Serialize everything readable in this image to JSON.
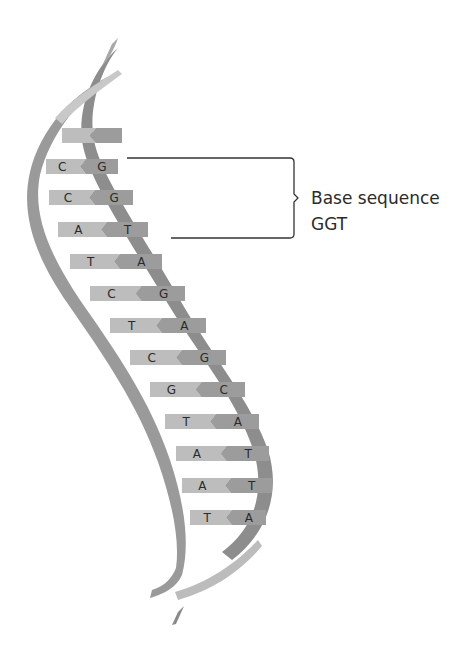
{
  "diagram": {
    "label": {
      "line1": "Base sequence",
      "line2": "GGT"
    },
    "colors": {
      "strand_back": "#8a8a8a",
      "strand_front": "#9a9a9a",
      "strand_light": "#c4c4c4",
      "base_light": "#bdbdbd",
      "base_dark": "#9c9c9c",
      "bracket": "#333333",
      "text": "#2b2b2b"
    },
    "rungs": [
      {
        "left": "",
        "right": "",
        "x": 62,
        "y": 128,
        "w": 60
      },
      {
        "left": "C",
        "right": "G",
        "x": 46,
        "y": 159,
        "w": 72
      },
      {
        "left": "C",
        "right": "G",
        "x": 49,
        "y": 190,
        "w": 84
      },
      {
        "left": "A",
        "right": "T",
        "x": 58,
        "y": 222,
        "w": 90
      },
      {
        "left": "T",
        "right": "A",
        "x": 70,
        "y": 254,
        "w": 92
      },
      {
        "left": "C",
        "right": "G",
        "x": 90,
        "y": 286,
        "w": 95
      },
      {
        "left": "T",
        "right": "A",
        "x": 110,
        "y": 318,
        "w": 96
      },
      {
        "left": "C",
        "right": "G",
        "x": 130,
        "y": 350,
        "w": 96
      },
      {
        "left": "G",
        "right": "C",
        "x": 150,
        "y": 382,
        "w": 95
      },
      {
        "left": "T",
        "right": "A",
        "x": 165,
        "y": 414,
        "w": 94
      },
      {
        "left": "A",
        "right": "T",
        "x": 176,
        "y": 446,
        "w": 93
      },
      {
        "left": "A",
        "right": "T",
        "x": 182,
        "y": 478,
        "w": 90
      },
      {
        "left": "T",
        "right": "A",
        "x": 190,
        "y": 510,
        "w": 76
      }
    ]
  }
}
